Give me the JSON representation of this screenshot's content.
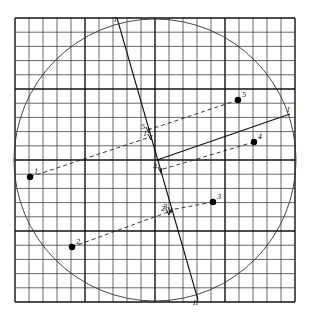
{
  "diagram": {
    "type": "principal-component-projection",
    "grid": {
      "x0": 15,
      "y0": 18,
      "x1": 295,
      "y1": 302,
      "cols": 20,
      "rows": 20,
      "major_every": 5
    },
    "circle": {
      "cx": 155,
      "cy": 160,
      "r": 141
    },
    "lines": {
      "main_axis": {
        "label": "I",
        "x1": 117,
        "y1": 18,
        "x2": 198,
        "y2": 300
      },
      "second_axis": {
        "label": "I",
        "x1": 157,
        "y1": 160,
        "x2": 290,
        "y2": 114
      }
    },
    "points": [
      {
        "id": "1",
        "label": "1",
        "x": 30,
        "y": 177,
        "proj_x": 150,
        "proj_y": 137,
        "proj_label": "1"
      },
      {
        "id": "2",
        "label": "2",
        "x": 72,
        "y": 247,
        "proj_x": 168,
        "proj_y": 212,
        "proj_label": "2"
      },
      {
        "id": "3",
        "label": "3",
        "x": 213,
        "y": 202,
        "proj_x": 170,
        "proj_y": 210,
        "proj_label": "3"
      },
      {
        "id": "4",
        "label": "4",
        "x": 254,
        "y": 142,
        "proj_x": 160,
        "proj_y": 170,
        "proj_label": "4"
      },
      {
        "id": "5",
        "label": "5",
        "x": 238,
        "y": 100,
        "proj_x": 148,
        "proj_y": 130,
        "proj_label": "5"
      }
    ],
    "end_labels": {
      "top": "I",
      "bottom": "II",
      "right": "I"
    }
  }
}
